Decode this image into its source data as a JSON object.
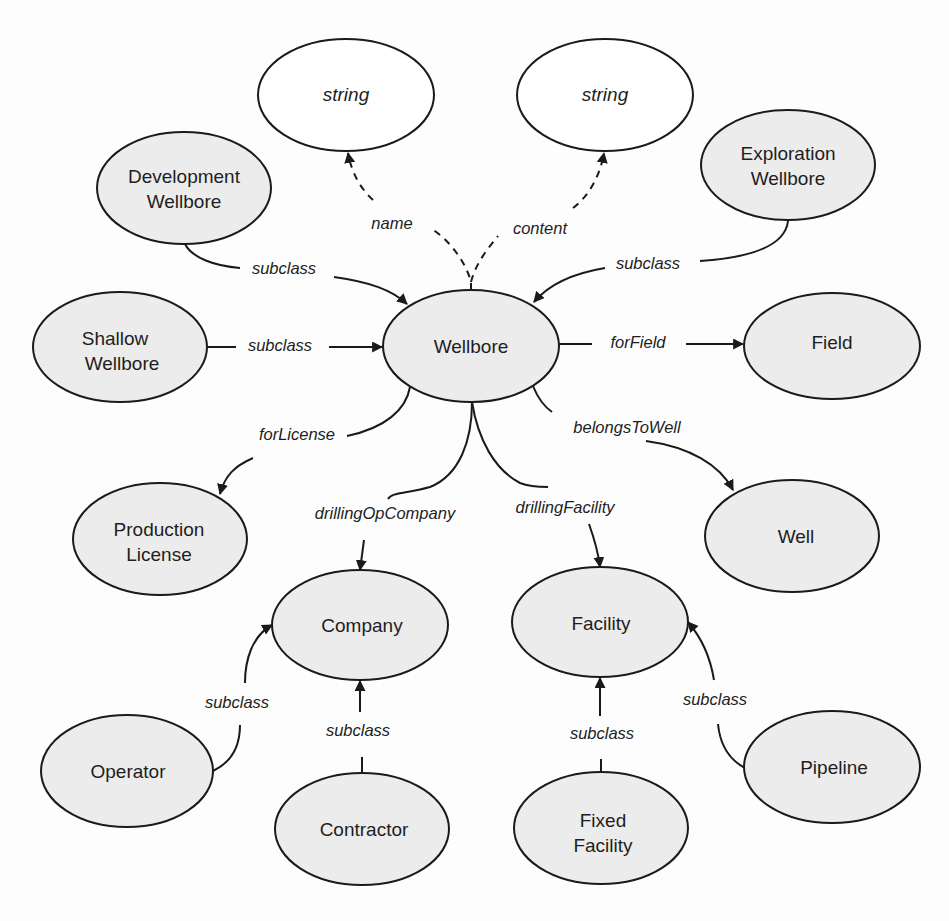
{
  "diagram": {
    "colors": {
      "background": "#fdfdfd",
      "class_fill": "#ececec",
      "literal_fill": "#ffffff",
      "stroke": "#1a1a1a",
      "text": "#1e1e1e"
    },
    "nodes": {
      "string_name": {
        "label": "string",
        "kind": "literal"
      },
      "string_content": {
        "label": "string",
        "kind": "literal"
      },
      "development_wellbore": {
        "line1": "Development",
        "line2": "Wellbore",
        "kind": "class"
      },
      "exploration_wellbore": {
        "line1": "Exploration",
        "line2": "Wellbore",
        "kind": "class"
      },
      "shallow_wellbore": {
        "line1": "Shallow",
        "line2": "Wellbore",
        "kind": "class"
      },
      "wellbore": {
        "label": "Wellbore",
        "kind": "class"
      },
      "field": {
        "label": "Field",
        "kind": "class"
      },
      "production_license": {
        "line1": "Production",
        "line2": "License",
        "kind": "class"
      },
      "well": {
        "label": "Well",
        "kind": "class"
      },
      "company": {
        "label": "Company",
        "kind": "class"
      },
      "facility": {
        "label": "Facility",
        "kind": "class"
      },
      "operator": {
        "label": "Operator",
        "kind": "class"
      },
      "contractor": {
        "label": "Contractor",
        "kind": "class"
      },
      "fixed_facility": {
        "line1": "Fixed",
        "line2": "Facility",
        "kind": "class"
      },
      "pipeline": {
        "label": "Pipeline",
        "kind": "class"
      }
    },
    "edges": {
      "name": {
        "label": "name",
        "from": "Wellbore",
        "to": "string",
        "style": "dashed"
      },
      "content": {
        "label": "content",
        "from": "Wellbore",
        "to": "string",
        "style": "dashed"
      },
      "dev_subclass": {
        "label": "subclass",
        "from": "Development Wellbore",
        "to": "Wellbore",
        "style": "solid"
      },
      "expl_subclass": {
        "label": "subclass",
        "from": "Exploration Wellbore",
        "to": "Wellbore",
        "style": "solid"
      },
      "shallow_subclass": {
        "label": "subclass",
        "from": "Shallow Wellbore",
        "to": "Wellbore",
        "style": "solid"
      },
      "for_field": {
        "label": "forField",
        "from": "Wellbore",
        "to": "Field",
        "style": "solid"
      },
      "for_license": {
        "label": "forLicense",
        "from": "Wellbore",
        "to": "Production License",
        "style": "solid"
      },
      "belongs_to_well": {
        "label": "belongsToWell",
        "from": "Wellbore",
        "to": "Well",
        "style": "solid"
      },
      "drilling_op_company": {
        "label": "drillingOpCompany",
        "from": "Wellbore",
        "to": "Company",
        "style": "solid"
      },
      "drilling_facility": {
        "label": "drillingFacility",
        "from": "Wellbore",
        "to": "Facility",
        "style": "solid"
      },
      "operator_subclass": {
        "label": "subclass",
        "from": "Operator",
        "to": "Company",
        "style": "solid"
      },
      "contractor_subclass": {
        "label": "subclass",
        "from": "Contractor",
        "to": "Company",
        "style": "solid"
      },
      "fixed_subclass": {
        "label": "subclass",
        "from": "Fixed Facility",
        "to": "Facility",
        "style": "solid"
      },
      "pipeline_subclass": {
        "label": "subclass",
        "from": "Pipeline",
        "to": "Facility",
        "style": "solid"
      }
    }
  }
}
